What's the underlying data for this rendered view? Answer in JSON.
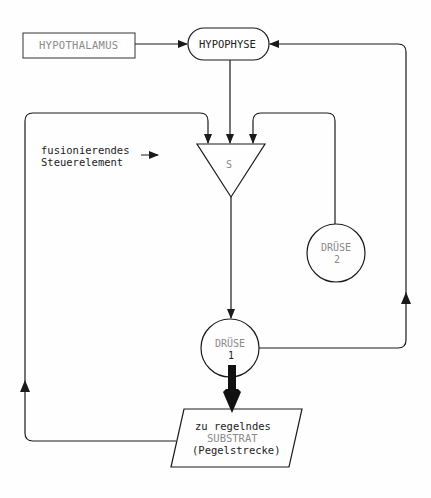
{
  "diagram": {
    "nodes": {
      "hypothalamus": {
        "label": "HYPOTHALAMUS",
        "shape": "rectangle"
      },
      "hypophyse": {
        "label": "HYPOPHYSE",
        "shape": "rounded-pill"
      },
      "steuerelement": {
        "label": "S",
        "shape": "inverted-triangle"
      },
      "druese2": {
        "label_line1": "DRÜSE",
        "label_line2": "2",
        "shape": "circle"
      },
      "druese1": {
        "label_line1": "DRÜSE",
        "label_line2": "1",
        "shape": "circle"
      },
      "substrat": {
        "label_line1": "zu regelndes",
        "label_line2": "SUBSTRAT",
        "label_line3": "(Pegelstrecke)",
        "shape": "parallelogram"
      }
    },
    "annotation": {
      "line1": "fusionierendes",
      "line2": "Steuerelement",
      "arrow": "→"
    },
    "edges": [
      {
        "from": "HYPOTHALAMUS",
        "to": "HYPOPHYSE"
      },
      {
        "from": "HYPOPHYSE",
        "to": "S"
      },
      {
        "from": "SUBSTRAT",
        "to": "S",
        "route": "left feedback loop"
      },
      {
        "from": "DRÜSE 2",
        "to": "S",
        "route": "right loop"
      },
      {
        "from": "S",
        "to": "DRÜSE 1"
      },
      {
        "from": "DRÜSE 1",
        "to": "HYPOPHYSE",
        "route": "far-right feedback loop"
      },
      {
        "from": "DRÜSE 1",
        "to": "SUBSTRAT",
        "style": "thick"
      }
    ],
    "colors": {
      "line": "#1a1a1a",
      "faint_text": "#8a8a8a",
      "text": "#222222"
    }
  }
}
